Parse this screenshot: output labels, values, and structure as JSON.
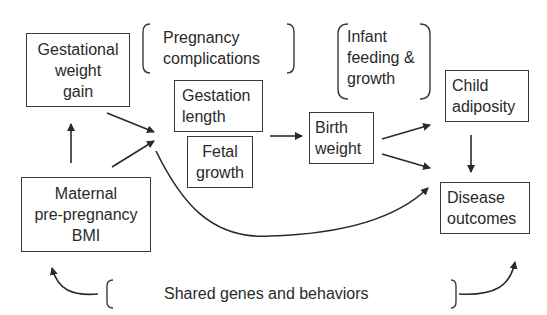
{
  "diagram": {
    "nodes": {
      "gestational_weight_gain": "Gestational\nweight\ngain",
      "maternal_bmi": "Maternal\npre-pregnancy\nBMI",
      "gestation_length": "Gestation\nlength",
      "fetal_growth": "Fetal\ngrowth",
      "birth_weight": "Birth\nweight",
      "child_adiposity": "Child\nadiposity",
      "disease_outcomes": "Disease\noutcomes"
    },
    "bracketed_factors": {
      "pregnancy_complications": "Pregnancy\ncomplications",
      "infant_feeding_growth": "Infant\nfeeding &\ngrowth",
      "shared_genes": "Shared genes and behaviors"
    },
    "edges": [
      {
        "from": "Maternal pre-pregnancy BMI",
        "to": "Gestational weight gain"
      },
      {
        "from": "Gestational weight gain",
        "to": "Gestation length / Fetal growth"
      },
      {
        "from": "Maternal pre-pregnancy BMI",
        "to": "Gestation length / Fetal growth"
      },
      {
        "from": "Gestation length / Fetal growth",
        "to": "Birth weight"
      },
      {
        "from": "Birth weight",
        "to": "Child adiposity"
      },
      {
        "from": "Birth weight",
        "to": "Disease outcomes"
      },
      {
        "from": "Maternal pre-pregnancy BMI",
        "to": "Disease outcomes"
      },
      {
        "from": "Child adiposity",
        "to": "Disease outcomes"
      },
      {
        "from": "Shared genes and behaviors",
        "to": "Maternal pre-pregnancy BMI"
      },
      {
        "from": "Shared genes and behaviors",
        "to": "Disease outcomes"
      }
    ]
  }
}
